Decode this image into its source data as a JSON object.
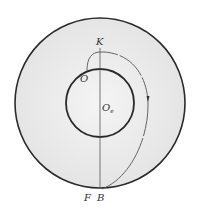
{
  "diagram": {
    "labels": {
      "K": "K",
      "O": "O",
      "Oe": "O",
      "Oe_sub": "e",
      "F": "F",
      "B": "B"
    },
    "colors": {
      "outer_fill": "#ececec",
      "inner_fill": "#efefef",
      "stroke": "#2a2a2a",
      "path": "#555555"
    }
  }
}
